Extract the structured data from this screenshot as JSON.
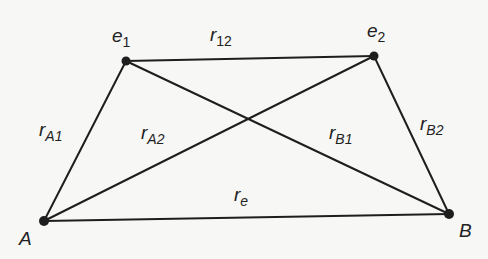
{
  "diagram": {
    "type": "network-graph",
    "colors": {
      "line": "#1e1e1e",
      "node": "#1e1e1e",
      "text": "#222222",
      "background": "#f7f7f5"
    },
    "nodes": [
      {
        "id": "e1",
        "label_main": "e",
        "label_sub": "1",
        "x": 126,
        "y": 61
      },
      {
        "id": "e2",
        "label_main": "e",
        "label_sub": "2",
        "x": 374,
        "y": 56
      },
      {
        "id": "A",
        "label_main": "A",
        "label_sub": "",
        "x": 44,
        "y": 221
      },
      {
        "id": "B",
        "label_main": "B",
        "label_sub": "",
        "x": 449,
        "y": 214
      }
    ],
    "edges": [
      {
        "from": "e1",
        "to": "e2",
        "label_main": "r",
        "label_sub": "12"
      },
      {
        "from": "A",
        "to": "e1",
        "label_main": "r",
        "label_sub": "A1"
      },
      {
        "from": "A",
        "to": "e2",
        "label_main": "r",
        "label_sub": "A2"
      },
      {
        "from": "B",
        "to": "e1",
        "label_main": "r",
        "label_sub": "B1"
      },
      {
        "from": "B",
        "to": "e2",
        "label_main": "r",
        "label_sub": "B2"
      },
      {
        "from": "A",
        "to": "B",
        "label_main": "r",
        "label_sub": "e"
      }
    ]
  }
}
